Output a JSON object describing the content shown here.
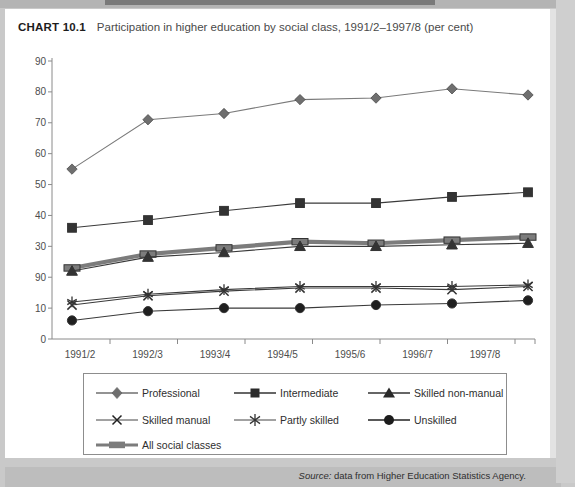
{
  "title": {
    "chart_number": "CHART 10.1",
    "caption": "Participation in higher education by social class, 1991/2–1997/8 (per cent)"
  },
  "source": {
    "prefix": "Source:",
    "text": "data from Higher Education Statistics Agency."
  },
  "legend": {
    "items": [
      {
        "label": "Professional",
        "marker": "diamond"
      },
      {
        "label": "Intermediate",
        "marker": "square"
      },
      {
        "label": "Skilled non-manual",
        "marker": "triangle"
      },
      {
        "label": "Skilled manual",
        "marker": "x"
      },
      {
        "label": "Partly skilled",
        "marker": "asterisk"
      },
      {
        "label": "Unskilled",
        "marker": "circle"
      },
      {
        "label": "All social classes",
        "marker": "thick-bar"
      }
    ]
  },
  "chart_data": {
    "type": "line",
    "title": "Participation in higher education by social class, 1991/2–1997/8 (per cent)",
    "xlabel": "",
    "ylabel": "",
    "ylim": [
      0,
      90
    ],
    "yticks": [
      0,
      10,
      20,
      30,
      40,
      50,
      60,
      70,
      80,
      90
    ],
    "ytick_labels": [
      "0",
      "10",
      "90",
      "30",
      "40",
      "50",
      "60",
      "70",
      "80",
      "90"
    ],
    "grid": false,
    "legend_position": "bottom",
    "categories": [
      "1991/2",
      "1992/3",
      "1993/4",
      "1994/5",
      "1995/6",
      "1996/7",
      "1997/8"
    ],
    "series": [
      {
        "name": "Professional",
        "marker": "diamond",
        "color": "#6f6f6f",
        "values": [
          55,
          71,
          73,
          77.5,
          78,
          81,
          79
        ]
      },
      {
        "name": "Intermediate",
        "marker": "square",
        "color": "#333333",
        "values": [
          36,
          38.5,
          41.5,
          44,
          44,
          46,
          47.5
        ]
      },
      {
        "name": "All social classes",
        "marker": "thick-bar",
        "color": "#7c7c7c",
        "values": [
          23,
          27.5,
          29.5,
          31.5,
          31,
          32,
          33
        ]
      },
      {
        "name": "Skilled non-manual",
        "marker": "triangle",
        "color": "#333333",
        "values": [
          22,
          26.5,
          28,
          30,
          30,
          30.5,
          31
        ]
      },
      {
        "name": "Partly skilled",
        "marker": "asterisk",
        "color": "#555555",
        "values": [
          12,
          14.5,
          16,
          17,
          17,
          17,
          17.5
        ]
      },
      {
        "name": "Skilled manual",
        "marker": "x",
        "color": "#333333",
        "values": [
          11,
          14,
          15.5,
          16.5,
          16.5,
          16,
          17
        ]
      },
      {
        "name": "Unskilled",
        "marker": "circle",
        "color": "#1f1f1f",
        "values": [
          6,
          9,
          10,
          10,
          11,
          11.5,
          12.5
        ]
      }
    ]
  }
}
